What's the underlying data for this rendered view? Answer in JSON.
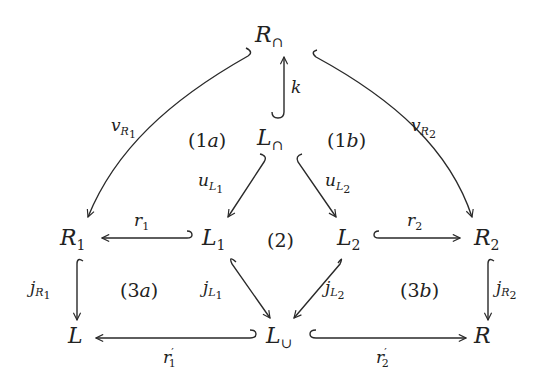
{
  "nodes": {
    "R_cap": {
      "base": "R",
      "sub": "∩"
    },
    "L_cap": {
      "base": "L",
      "sub": "∩"
    },
    "R1": {
      "base": "R",
      "sub": "1"
    },
    "L1": {
      "base": "L",
      "sub": "1"
    },
    "L2": {
      "base": "L",
      "sub": "2"
    },
    "R2": {
      "base": "R",
      "sub": "2"
    },
    "L": {
      "base": "L",
      "sub": ""
    },
    "L_cup": {
      "base": "L",
      "sub": "∪"
    },
    "R": {
      "base": "R",
      "sub": ""
    }
  },
  "edges": {
    "k": {
      "from": "L_cap",
      "to": "R_cap",
      "label": "k",
      "label_sub": "",
      "label_subsub": "",
      "type": "inclusion"
    },
    "v_R1": {
      "from": "R_cap",
      "to": "R1",
      "label": "v",
      "label_sub": "R",
      "label_subsub": "1",
      "type": "inclusion"
    },
    "v_R2": {
      "from": "R_cap",
      "to": "R2",
      "label": "v",
      "label_sub": "R",
      "label_subsub": "2",
      "type": "inclusion"
    },
    "u_L1": {
      "from": "L_cap",
      "to": "L1",
      "label": "u",
      "label_sub": "L",
      "label_subsub": "1",
      "type": "inclusion"
    },
    "u_L2": {
      "from": "L_cap",
      "to": "L2",
      "label": "u",
      "label_sub": "L",
      "label_subsub": "2",
      "type": "inclusion"
    },
    "r1": {
      "from": "L1",
      "to": "R1",
      "label": "r",
      "label_sub": "1",
      "label_subsub": "",
      "type": "inclusion"
    },
    "r2": {
      "from": "L2",
      "to": "R2",
      "label": "r",
      "label_sub": "2",
      "label_subsub": "",
      "type": "inclusion"
    },
    "j_R1": {
      "from": "R1",
      "to": "L",
      "label": "j",
      "label_sub": "R",
      "label_subsub": "1",
      "type": "inclusion"
    },
    "j_R2": {
      "from": "R2",
      "to": "R",
      "label": "j",
      "label_sub": "R",
      "label_subsub": "2",
      "type": "inclusion"
    },
    "j_L1": {
      "from": "L1",
      "to": "L_cup",
      "label": "j",
      "label_sub": "L",
      "label_subsub": "1",
      "type": "inclusion"
    },
    "j_L2": {
      "from": "L2",
      "to": "L_cup",
      "label": "j",
      "label_sub": "L",
      "label_subsub": "2",
      "type": "inclusion"
    },
    "r1p": {
      "from": "L_cup",
      "to": "L",
      "label": "r",
      "label_prime": "′",
      "label_sub": "1",
      "type": "inclusion"
    },
    "r2p": {
      "from": "L_cup",
      "to": "R",
      "label": "r",
      "label_prime": "′",
      "label_sub": "2",
      "type": "inclusion"
    }
  },
  "regions": {
    "1a": {
      "num": "1",
      "letter": "a"
    },
    "1b": {
      "num": "1",
      "letter": "b"
    },
    "2": {
      "num": "2",
      "letter": ""
    },
    "3a": {
      "num": "3",
      "letter": "a"
    },
    "3b": {
      "num": "3",
      "letter": "b"
    }
  },
  "parens": {
    "open": "(",
    "close": ")"
  }
}
